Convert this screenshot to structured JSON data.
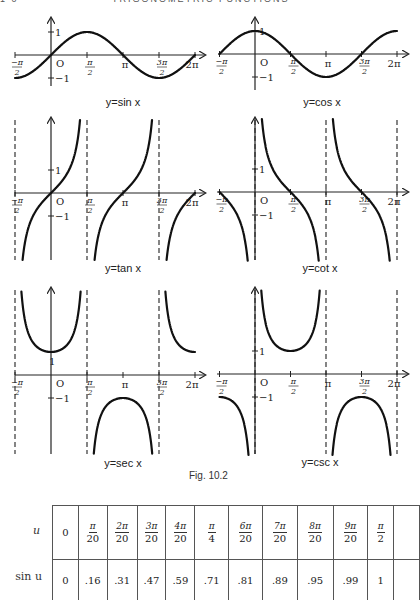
{
  "page": {
    "clipped_header_left": "1 0",
    "clipped_header_title": "TRIGONOMETRIC FUNCTIONS"
  },
  "figure": {
    "caption": "Fig. 10.2",
    "graphs": [
      {
        "id": "sin",
        "label": "y=sin x",
        "function": "sin",
        "x_range": [
          "-π/2",
          "2π"
        ],
        "x_ticks": [
          "-π/2",
          "O",
          "π/2",
          "π",
          "3π/2",
          "2π"
        ],
        "y_ticks": [
          "1",
          "-1"
        ],
        "asymptotes": []
      },
      {
        "id": "cos",
        "label": "y=cos x",
        "function": "cos",
        "x_range": [
          "-π/2",
          "2π"
        ],
        "x_ticks": [
          "-π/2",
          "O",
          "π/2",
          "π",
          "3π/2",
          "2π"
        ],
        "y_ticks": [
          "1",
          "-1"
        ],
        "asymptotes": []
      },
      {
        "id": "tan",
        "label": "y=tan x",
        "function": "tan",
        "x_range": [
          "-π/2",
          "2π"
        ],
        "x_ticks": [
          "-π/2",
          "O",
          "π/2",
          "π",
          "3π/2",
          "2π"
        ],
        "y_ticks": [
          "1",
          "-1"
        ],
        "asymptotes": [
          "-π/2",
          "π/2",
          "3π/2"
        ]
      },
      {
        "id": "cot",
        "label": "y=cot x",
        "function": "cot",
        "x_range": [
          "-π/2",
          "2π"
        ],
        "x_ticks": [
          "-π/2",
          "O",
          "π/2",
          "π",
          "3π/2",
          "2π"
        ],
        "y_ticks": [
          "1",
          "-1"
        ],
        "asymptotes": [
          "0",
          "π",
          "2π"
        ]
      },
      {
        "id": "sec",
        "label": "y=sec x",
        "function": "sec",
        "x_range": [
          "-π/2",
          "2π"
        ],
        "x_ticks": [
          "-π/2",
          "O",
          "π/2",
          "π",
          "3π/2",
          "2π"
        ],
        "y_ticks": [
          "1",
          "-1"
        ],
        "asymptotes": [
          "-π/2",
          "π/2",
          "3π/2"
        ]
      },
      {
        "id": "csc",
        "label": "y=csc x",
        "function": "csc",
        "x_range": [
          "-π/2",
          "2π"
        ],
        "x_ticks": [
          "-π/2",
          "O",
          "π/2",
          "π",
          "3π/2",
          "2π"
        ],
        "y_ticks": [
          "1",
          "-1"
        ],
        "asymptotes": [
          "0",
          "π",
          "2π"
        ]
      }
    ]
  },
  "table": {
    "row_labels": [
      "u",
      "sin u"
    ],
    "u_values": [
      {
        "num": "",
        "den": "",
        "plain": "0"
      },
      {
        "num": "π",
        "den": "20"
      },
      {
        "num": "2π",
        "den": "20"
      },
      {
        "num": "3π",
        "den": "20"
      },
      {
        "num": "4π",
        "den": "20"
      },
      {
        "num": "π",
        "den": "4"
      },
      {
        "num": "6π",
        "den": "20"
      },
      {
        "num": "7π",
        "den": "20"
      },
      {
        "num": "8π",
        "den": "20"
      },
      {
        "num": "9π",
        "den": "20"
      },
      {
        "num": "π",
        "den": "2"
      },
      {
        "num": "",
        "den": "",
        "plain": ""
      }
    ],
    "sin_values": [
      "0",
      ".16",
      ".31",
      ".47",
      ".59",
      ".71",
      ".81",
      ".89",
      ".95",
      ".99",
      "1",
      ""
    ]
  },
  "chart_data": {
    "type": "table",
    "title": "Fig. 10.2",
    "columns": [
      "0",
      "π/20",
      "2π/20",
      "3π/20",
      "4π/20",
      "π/4",
      "6π/20",
      "7π/20",
      "8π/20",
      "9π/20",
      "π/2"
    ],
    "rows": [
      {
        "label": "u",
        "values": [
          0,
          0.157,
          0.314,
          0.471,
          0.628,
          0.785,
          0.942,
          1.1,
          1.257,
          1.414,
          1.571
        ]
      },
      {
        "label": "sin u",
        "values": [
          0,
          0.16,
          0.31,
          0.47,
          0.59,
          0.71,
          0.81,
          0.89,
          0.95,
          0.99,
          1
        ]
      }
    ],
    "plots": [
      {
        "type": "line",
        "title": "y=sin x",
        "xlim": [
          "-π/2",
          "2π"
        ],
        "ylim": [
          -1,
          1
        ],
        "x_ticks": [
          "-π/2",
          "π/2",
          "π",
          "3π/2",
          "2π"
        ],
        "y_ticks": [
          1,
          -1
        ]
      },
      {
        "type": "line",
        "title": "y=cos x",
        "xlim": [
          "-π/2",
          "2π"
        ],
        "ylim": [
          -1,
          1
        ],
        "x_ticks": [
          "-π/2",
          "π/2",
          "π",
          "3π/2",
          "2π"
        ],
        "y_ticks": [
          1,
          -1
        ]
      },
      {
        "type": "line",
        "title": "y=tan x",
        "xlim": [
          "-π/2",
          "2π"
        ],
        "asymptotes": [
          "-π/2",
          "π/2",
          "3π/2"
        ],
        "y_ticks": [
          1,
          -1
        ]
      },
      {
        "type": "line",
        "title": "y=cot x",
        "xlim": [
          "-π/2",
          "2π"
        ],
        "asymptotes": [
          "0",
          "π",
          "2π"
        ],
        "y_ticks": [
          1,
          -1
        ]
      },
      {
        "type": "line",
        "title": "y=sec x",
        "xlim": [
          "-π/2",
          "2π"
        ],
        "asymptotes": [
          "-π/2",
          "π/2",
          "3π/2"
        ],
        "y_ticks": [
          1,
          -1
        ]
      },
      {
        "type": "line",
        "title": "y=csc x",
        "xlim": [
          "-π/2",
          "2π"
        ],
        "asymptotes": [
          "0",
          "π",
          "2π"
        ],
        "y_ticks": [
          1,
          -1
        ]
      }
    ]
  }
}
